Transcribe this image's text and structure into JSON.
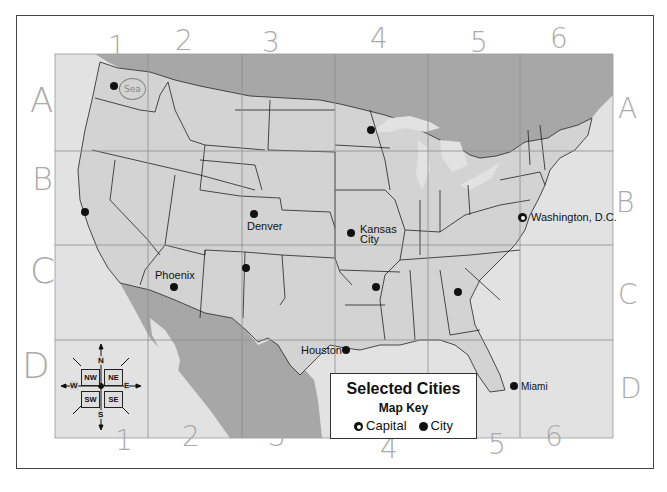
{
  "map": {
    "title": "Selected Cities",
    "key_title": "Map Key",
    "legend": [
      {
        "symbol": "capital-star-icon",
        "label": "Capital"
      },
      {
        "symbol": "city-dot-icon",
        "label": "City"
      }
    ],
    "colors": {
      "us_land": "#d3d3d3",
      "foreign_land": "#a9a9a9",
      "water": "#e4e4e4",
      "grid_line": "#8e8e8e",
      "state_border": "#222222",
      "text": "#111111",
      "handwriting": "#aaaaaa"
    },
    "grid": {
      "columns": [
        "1",
        "2",
        "3",
        "4",
        "5",
        "6"
      ],
      "rows": [
        "A",
        "B",
        "C",
        "D"
      ]
    },
    "cities": [
      {
        "name": "",
        "type": "city",
        "grid": "A1"
      },
      {
        "name": "",
        "type": "city",
        "grid": "B1"
      },
      {
        "name": "Denver",
        "type": "city",
        "grid": "B3"
      },
      {
        "name": "Kansas City",
        "name_line1": "Kansas",
        "name_line2": "City",
        "type": "city",
        "grid": "B4"
      },
      {
        "name": "Phoenix",
        "type": "city",
        "grid": "C2"
      },
      {
        "name": "",
        "type": "city",
        "grid": "C3"
      },
      {
        "name": "",
        "type": "city",
        "grid": "C4"
      },
      {
        "name": "",
        "type": "city",
        "grid": "C5"
      },
      {
        "name": "",
        "type": "city",
        "grid": "A4"
      },
      {
        "name": "Houston",
        "type": "city",
        "grid": "D4"
      },
      {
        "name": "Miami",
        "type": "city",
        "grid": "D5"
      },
      {
        "name": "Washington, D.C.",
        "type": "capital",
        "grid": "B6"
      }
    ],
    "compass": {
      "N": "N",
      "S": "S",
      "E": "E",
      "W": "W",
      "NW": "NW",
      "NE": "NE",
      "SW": "SW",
      "SE": "SE"
    },
    "annotations": {
      "handwritten_columns_top": [
        "1",
        "2",
        "3",
        "4",
        "5",
        "6"
      ],
      "handwritten_columns_bottom": [
        "1",
        "2",
        "3",
        "4",
        "5",
        "6"
      ],
      "handwritten_rows_left": [
        "A",
        "B",
        "C",
        "D"
      ],
      "handwritten_rows_right": [
        "A",
        "B",
        "C",
        "D"
      ],
      "circled_note": "Sea"
    }
  }
}
